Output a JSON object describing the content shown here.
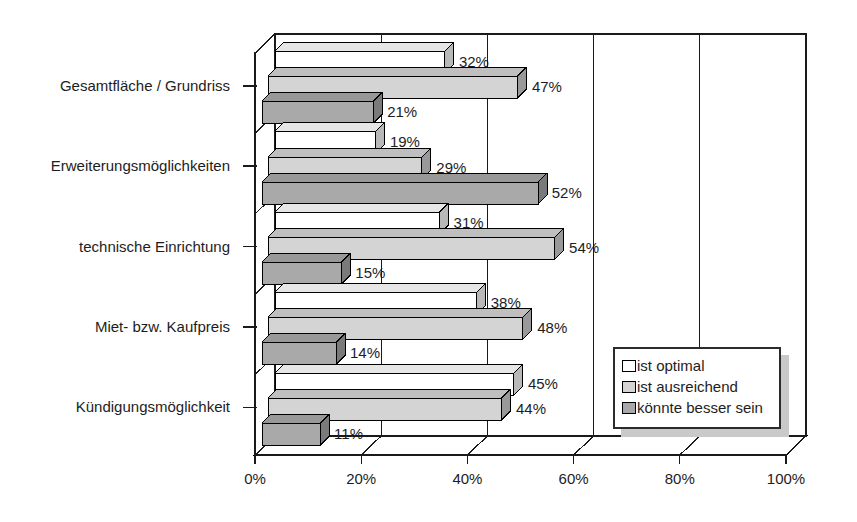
{
  "chart_data": {
    "type": "bar",
    "orientation": "horizontal",
    "title": "",
    "subtitle": "",
    "xlabel": "",
    "ylabel": "",
    "xlim": [
      0,
      100
    ],
    "xticks": [
      "0%",
      "20%",
      "40%",
      "60%",
      "80%",
      "100%"
    ],
    "xtick_values": [
      0,
      20,
      40,
      60,
      80,
      100
    ],
    "grid": true,
    "grid_axis": "x",
    "legend_position": "inside-right",
    "categories": [
      "Gesamtfläche / Grundriss",
      "Erweiterungsmöglichkeiten",
      "technische Einrichtung",
      "Miet- bzw. Kaufpreis",
      "Kündigungsmöglichkeit"
    ],
    "series": [
      {
        "name": "ist optimal",
        "color": "#ffffff",
        "values": [
          32,
          19,
          31,
          38,
          45
        ],
        "labels": [
          "32%",
          "19%",
          "31%",
          "38%",
          "45%"
        ]
      },
      {
        "name": "ist ausreichend",
        "color": "#d4d4d4",
        "values": [
          47,
          29,
          54,
          48,
          44
        ],
        "labels": [
          "47%",
          "29%",
          "54%",
          "48%",
          "44%"
        ]
      },
      {
        "name": "könnte besser sein",
        "color": "#a9a9a9",
        "values": [
          21,
          52,
          15,
          14,
          11
        ],
        "labels": [
          "21%",
          "52%",
          "15%",
          "14%",
          "11%"
        ]
      }
    ]
  },
  "legend": {
    "items": [
      {
        "label": "ist optimal",
        "color": "#ffffff"
      },
      {
        "label": "ist ausreichend",
        "color": "#d4d4d4"
      },
      {
        "label": "könnte besser sein",
        "color": "#a9a9a9"
      }
    ]
  },
  "colors": {
    "series_optimal": "#ffffff",
    "series_ausreichend": "#d4d4d4",
    "series_besser": "#a9a9a9",
    "axis": "#000000",
    "text": "#1d1d1d",
    "legend_shadow": "#c9c9c9"
  }
}
